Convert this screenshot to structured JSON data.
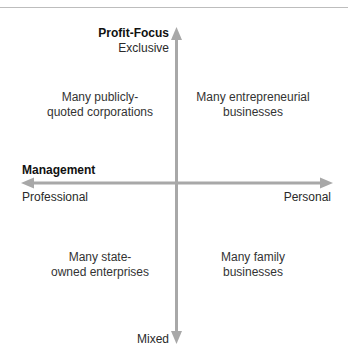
{
  "header": {
    "cut_off_text": "Family-owned businesses and their peers"
  },
  "axes": {
    "vertical": {
      "title": "Profit-Focus",
      "top_label": "Exclusive",
      "bottom_label": "Mixed"
    },
    "horizontal": {
      "title": "Management",
      "left_label": "Professional",
      "right_label": "Personal"
    },
    "color": "#a8a8a8"
  },
  "quadrants": {
    "top_left": {
      "line1": "Many publicly-",
      "line2": "quoted corporations"
    },
    "top_right": {
      "line1": "Many entrepreneurial",
      "line2": "businesses"
    },
    "bottom_left": {
      "line1": "Many state-",
      "line2": "owned enterprises"
    },
    "bottom_right": {
      "line1": "Many family",
      "line2": "businesses"
    }
  }
}
